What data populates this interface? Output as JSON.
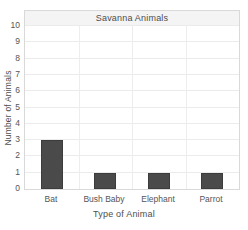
{
  "chart_data": {
    "type": "bar",
    "title": "Savanna Animals",
    "categories": [
      "Bat",
      "Bush Baby",
      "Elephant",
      "Parrot"
    ],
    "values": [
      3,
      1,
      1,
      1
    ],
    "xlabel": "Type of Animal",
    "ylabel": "Number of Animals",
    "ylim": [
      0,
      10
    ],
    "ytick_step": 1,
    "grid": true,
    "legend": "none",
    "bar_color": "#4a4a4a",
    "bar_border_color": "#3c3c3c"
  },
  "colors": {
    "background": "#ffffff",
    "grid_line": "#ebebeb",
    "axis_border": "#d9d9d9",
    "title_band_bg": "#f4f4f4",
    "title_band_border": "#e2e2e2",
    "text": "#4d4d4d",
    "tick_text": "#555555"
  }
}
